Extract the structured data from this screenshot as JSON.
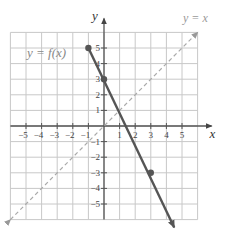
{
  "chart_data": {
    "type": "line",
    "title": "",
    "xlabel": "x",
    "ylabel": "y",
    "xlim": [
      -6,
      6
    ],
    "ylim": [
      -6,
      6
    ],
    "grid": true,
    "x_ticks": [
      -5,
      -4,
      -3,
      -2,
      -1,
      1,
      2,
      3,
      4,
      5
    ],
    "y_ticks": [
      5,
      4,
      3,
      2,
      1,
      -1,
      -2,
      -3,
      -4,
      -5
    ],
    "x_tick_labels": [
      "−5",
      "−4",
      "−3",
      "−2",
      "−1",
      "1",
      "2",
      "3",
      "4",
      "5"
    ],
    "y_tick_labels": [
      "5",
      "4",
      "3",
      "2",
      "1",
      "−1",
      "−2",
      "−3",
      "−4",
      "−5"
    ],
    "series": [
      {
        "name": "y = f(x)",
        "style": "solid",
        "color": "#555555",
        "points": [
          [
            -1,
            5
          ],
          [
            0,
            3
          ],
          [
            3,
            -3
          ]
        ],
        "start": [
          -1,
          5
        ],
        "start_marker": "closed-dot",
        "end_arrow": [
          4.5,
          -6.5
        ],
        "slope": -2,
        "intercept": 3
      },
      {
        "name": "y = x",
        "style": "dashed",
        "color": "#aaaaaa",
        "from": [
          -6,
          -6
        ],
        "to": [
          6,
          6
        ],
        "arrows": "both"
      }
    ],
    "annotations": [
      {
        "text": "y = f(x)",
        "position": "upper-left"
      },
      {
        "text": "y = x",
        "position": "upper-right"
      }
    ]
  },
  "labels": {
    "x_axis": "x",
    "y_axis": "y",
    "fn_label": "y = f(x)",
    "identity_label": "y = x"
  }
}
